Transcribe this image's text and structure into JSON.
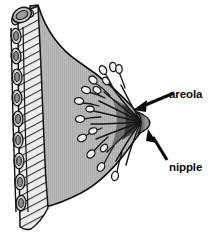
{
  "figure": {
    "type": "anatomical-diagram",
    "width": 218,
    "height": 236,
    "background_color": "#ffffff"
  },
  "labels": [
    {
      "id": "areola",
      "text": "areola",
      "x": 169,
      "y": 89,
      "color": "#0b0b0b",
      "arrow": {
        "name": "areola-arrow",
        "from_x": 176,
        "from_y": 93,
        "to_x": 135,
        "to_y": 110,
        "direction": "down-left"
      }
    },
    {
      "id": "nipple",
      "text": "nipple",
      "x": 169,
      "y": 162,
      "color": "#0b0b0b",
      "arrow": {
        "name": "nipple-arrow",
        "from_x": 169,
        "from_y": 161,
        "to_x": 147,
        "to_y": 130,
        "direction": "up-left"
      }
    }
  ],
  "structures": {
    "breast_tissue": {
      "name": "breast-tissue",
      "fill_color": "#b8b8b8",
      "outline_color": "#111111",
      "texture": "fine-vertical-striations"
    },
    "chest_muscle": {
      "name": "chest-muscle",
      "fill_color": "#e8e8e8",
      "outline_color": "#1a1a1a",
      "texture": "diagonal-striations"
    },
    "ribs": {
      "name": "rib-segments",
      "fill_color": "#d4d4d4",
      "outline_color": "#111111",
      "count": 9,
      "shape": "oval-cross-sections"
    },
    "top_rib_cylinder": {
      "name": "top-rib-cylinder",
      "fill_color": "#c9c9c9",
      "outline_color": "#111111"
    },
    "mammary_glands": {
      "name": "mammary-gland-lobules",
      "lobule_fill": "#f2f2f2",
      "duct_color": "#1a1a1a",
      "branch_count": 14,
      "description": "lobules radiating from nipple via lactiferous ducts"
    },
    "areola_region": {
      "name": "areola-region",
      "fill_color": "#4a4a4a"
    },
    "nipple_tip": {
      "name": "nipple-tip",
      "fill_color": "#8a8a8a"
    }
  }
}
